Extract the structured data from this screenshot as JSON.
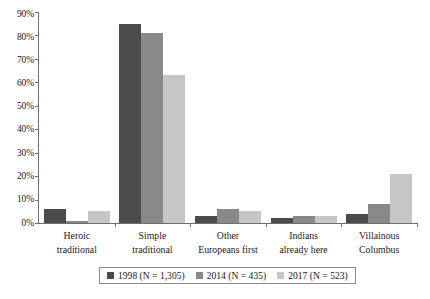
{
  "chart_data": {
    "type": "bar",
    "title": "",
    "subtitle": "",
    "xlabel": "",
    "ylabel": "",
    "ylim": [
      0,
      90
    ],
    "ytick_labels": [
      "0%",
      "10%",
      "20%",
      "30%",
      "40%",
      "50%",
      "60%",
      "70%",
      "80%",
      "90%"
    ],
    "ytick_values": [
      0,
      10,
      20,
      30,
      40,
      50,
      60,
      70,
      80,
      90
    ],
    "grid": false,
    "legend_position": "bottom",
    "categories": [
      "Heroic traditional",
      "Simple traditional",
      "Other Europeans first",
      "Indians already here",
      "Villainous Columbus"
    ],
    "category_lines": [
      [
        "Heroic",
        "traditional"
      ],
      [
        "Simple",
        "traditional"
      ],
      [
        "Other",
        "Europeans first"
      ],
      [
        "Indians",
        "already here"
      ],
      [
        "Villainous",
        "Columbus"
      ]
    ],
    "series": [
      {
        "name": "1998 (N = 1,305)",
        "year": "1998",
        "n": "1,305",
        "color": "#4b4b4b",
        "values": [
          6,
          85,
          3,
          2,
          4
        ]
      },
      {
        "name": "2014 (N = 435)",
        "year": "2014",
        "n": "435",
        "color": "#898989",
        "values": [
          1,
          81,
          6,
          3,
          8
        ]
      },
      {
        "name": "2017 (N = 523)",
        "year": "2017",
        "n": "523",
        "color": "#c6c6c6",
        "values": [
          5,
          63,
          5,
          3,
          21
        ]
      }
    ]
  },
  "legend": {
    "items": [
      {
        "label": "1998 (N = 1,305)",
        "swatch": "dark-gray-swatch"
      },
      {
        "label": "2014 (N = 435)",
        "swatch": "medium-gray-swatch"
      },
      {
        "label": "2017 (N = 523)",
        "swatch": "light-gray-swatch"
      }
    ]
  },
  "axes": {
    "y_labels": [
      "90%",
      "80%",
      "70%",
      "60%",
      "50%",
      "40%",
      "30%",
      "20%",
      "10%",
      "0%"
    ]
  }
}
